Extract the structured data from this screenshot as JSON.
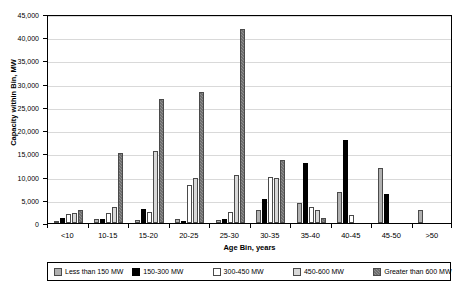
{
  "chart_data": {
    "type": "bar",
    "title": "",
    "xlabel": "Age Bin, years",
    "ylabel": "Capacity within Bin, MW",
    "ylim": [
      0,
      45000
    ],
    "ytick_step": 5000,
    "grid": true,
    "legend_position": "bottom",
    "categories": [
      "<10",
      "10-15",
      "15-20",
      "20-25",
      "25-30",
      "30-35",
      "35-40",
      "40-45",
      "45-50",
      ">50"
    ],
    "ytick_labels": [
      "0",
      "5,000",
      "10,000",
      "15,000",
      "20,000",
      "25,000",
      "30,000",
      "35,000",
      "40,000",
      "45,000"
    ],
    "series": [
      {
        "name": "Less than 150 MW",
        "color": "#b0b0b0",
        "pattern": "solid-light-gray",
        "values": [
          500,
          800,
          550,
          900,
          600,
          2800,
          4300,
          6700,
          11900,
          2900
        ]
      },
      {
        "name": "150-300 MW",
        "color": "#000000",
        "pattern": "solid-black",
        "values": [
          1100,
          850,
          2950,
          450,
          800,
          5200,
          12900,
          17900,
          6200,
          0
        ]
      },
      {
        "name": "300-450 MW",
        "color": "#ffffff",
        "pattern": "open-white",
        "values": [
          1950,
          2100,
          2300,
          8100,
          2400,
          9900,
          3400,
          1700,
          0,
          0
        ]
      },
      {
        "name": "450-600 MW",
        "color": "#d8d8d8",
        "pattern": "solid-pale-gray",
        "values": [
          2100,
          3550,
          15600,
          9750,
          10350,
          9700,
          2700,
          0,
          0,
          0
        ]
      },
      {
        "name": "Greater than 600 MW",
        "color": "#8e8e8e",
        "pattern": "hatched-gray",
        "values": [
          2900,
          15100,
          26800,
          28300,
          41800,
          13600,
          1000,
          0,
          0,
          0
        ]
      }
    ]
  }
}
